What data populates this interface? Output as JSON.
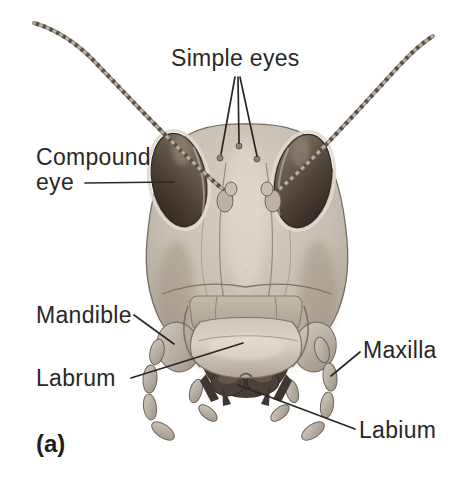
{
  "figure": {
    "panel_label": "(a)"
  },
  "labels": {
    "simple_eyes": "Simple eyes",
    "compound_eye": "Compound eye",
    "mandible": "Mandible",
    "labrum": "Labrum",
    "maxilla": "Maxilla",
    "labium": "Labium"
  },
  "colors": {
    "background": "#ffffff",
    "ink": "#2b2725",
    "head_light": "#d7d1c6",
    "head_mid": "#c0b7aa",
    "head_shadow": "#a49a8c",
    "eye_dark": "#2e2620",
    "eye_light": "#8d8172",
    "labrum_highlight": "#d9d3c7",
    "labium_dark": "#433a31"
  }
}
